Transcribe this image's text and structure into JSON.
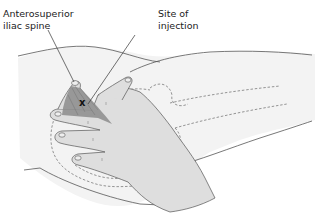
{
  "figure": {
    "labels": {
      "anterosuperior_iliac_spine": "Anterosuperior\niliac spine",
      "site_of_injection": "Site of\ninjection"
    },
    "injection_marker": "x",
    "colors": {
      "skin_fill": "#f2f2f2",
      "hand_fill": "#dcdcdc",
      "triangle_shade": "#8c8c8c",
      "outline": "#555555",
      "dashed_contour": "#6a6a6a"
    }
  }
}
